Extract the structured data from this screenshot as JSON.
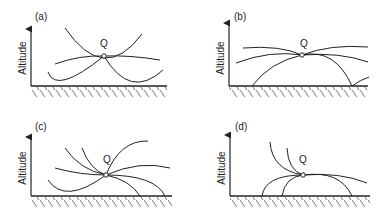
{
  "figure": {
    "axis_label": "Altitude",
    "point_label": "Q",
    "panels": [
      {
        "id": "a",
        "label": "(a)"
      },
      {
        "id": "b",
        "label": "(b)"
      },
      {
        "id": "c",
        "label": "(c)"
      },
      {
        "id": "d",
        "label": "(d)"
      }
    ]
  }
}
